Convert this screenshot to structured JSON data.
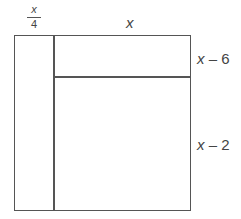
{
  "diagram": {
    "type": "area-model-rectangle",
    "labels": {
      "left_strip_width": {
        "numerator": "x",
        "denominator": "4"
      },
      "top_width": "x",
      "upper_right_height": {
        "var": "x",
        "op": " – ",
        "const": "6"
      },
      "lower_right_height": {
        "var": "x",
        "op": " – ",
        "const": "2"
      }
    },
    "colors": {
      "line": "#555555",
      "text": "#444444",
      "background": "#ffffff"
    }
  }
}
